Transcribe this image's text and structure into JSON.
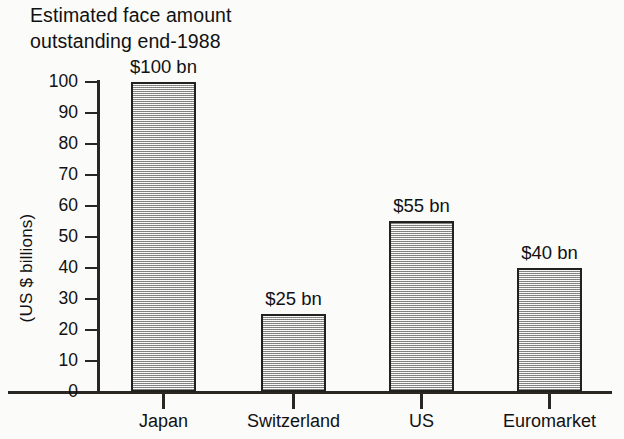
{
  "chart_data": {
    "type": "bar",
    "title": "Estimated face amount\noutstanding end-1988",
    "title_line1": "Estimated face amount",
    "title_line2": "outstanding end-1988",
    "xlabel": "",
    "ylabel": "(US $ billions)",
    "categories": [
      "Japan",
      "Switzerland",
      "US",
      "Euromarket"
    ],
    "values": [
      100,
      25,
      55,
      40
    ],
    "value_labels": [
      "$100 bn",
      "$25 bn",
      "$55 bn",
      "$40 bn"
    ],
    "ylim": [
      0,
      100
    ],
    "ytick_values": [
      0,
      10,
      20,
      30,
      40,
      50,
      60,
      70,
      80,
      90,
      100
    ],
    "ytick_labels": [
      "0",
      "10",
      "20",
      "30",
      "40",
      "50",
      "60",
      "70",
      "80",
      "90",
      "100"
    ],
    "grid": false,
    "legend": null,
    "series": [
      {
        "name": "Estimated face amount outstanding end-1988",
        "values": [
          100,
          25,
          55,
          40
        ],
        "unit": "US $ billions",
        "fill": "#c9c9c7",
        "edge": "#23211e"
      }
    ],
    "colors": {
      "background": "#fbfbfa",
      "bar_fill": "#c9c9c7",
      "bar_edge": "#23211e",
      "axis": "#2a2723",
      "text": "#111111"
    }
  }
}
